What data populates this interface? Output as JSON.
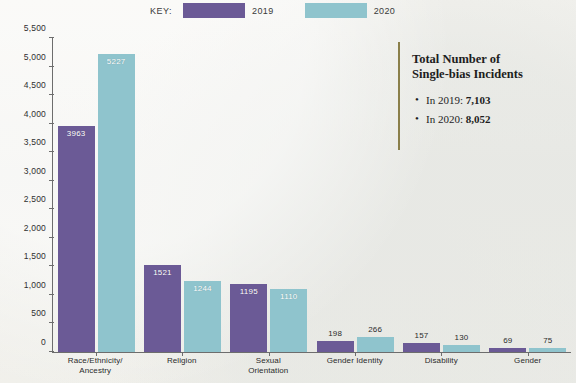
{
  "legend": {
    "key_label": "KEY:",
    "items": [
      {
        "label": "2019",
        "color": "#6b5a96"
      },
      {
        "label": "2020",
        "color": "#8fc4cd"
      }
    ]
  },
  "callout": {
    "title_line1": "Total Number of",
    "title_line2": "Single-bias Incidents",
    "items": [
      {
        "prefix": "In 2019: ",
        "value": "7,103"
      },
      {
        "prefix": "In 2020: ",
        "value": "8,052"
      }
    ]
  },
  "chart_data": {
    "type": "bar",
    "title": "",
    "xlabel": "",
    "ylabel": "",
    "ylim": [
      0,
      5500
    ],
    "grid": false,
    "legend_position": "top",
    "categories": [
      "Race/Ethnicity/\nAncestry",
      "Religion",
      "Sexual\nOrientation",
      "Gender Identity",
      "Disability",
      "Gender"
    ],
    "category_lines": [
      [
        "Race/Ethnicity/",
        "Ancestry"
      ],
      [
        "Religion",
        ""
      ],
      [
        "Sexual",
        "Orientation"
      ],
      [
        "Gender Identity",
        ""
      ],
      [
        "Disability",
        ""
      ],
      [
        "Gender",
        ""
      ]
    ],
    "ytick_labels": [
      "5,500",
      "5,000",
      "4,500",
      "4,000",
      "3,500",
      "3,000",
      "2,500",
      "2,000",
      "1,500",
      "1,000",
      "500",
      "0"
    ],
    "ytick_values": [
      5500,
      5000,
      4500,
      4000,
      3500,
      3000,
      2500,
      2000,
      1500,
      1000,
      500,
      0
    ],
    "series": [
      {
        "name": "2019",
        "color": "#6b5a96",
        "values": [
          3963,
          1521,
          1195,
          198,
          157,
          69
        ],
        "labels": [
          "3963",
          "1521",
          "1195",
          "198",
          "157",
          "69"
        ]
      },
      {
        "name": "2020",
        "color": "#8fc4cd",
        "values": [
          5227,
          1244,
          1110,
          266,
          130,
          75
        ],
        "labels": [
          "5227",
          "1244",
          "1110",
          "266",
          "130",
          "75"
        ]
      }
    ]
  }
}
